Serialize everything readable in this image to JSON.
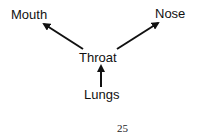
{
  "diagram": {
    "nodes": [
      {
        "id": "mouth",
        "label": "Mouth"
      },
      {
        "id": "nose",
        "label": "Nose"
      },
      {
        "id": "throat",
        "label": "Throat"
      },
      {
        "id": "lungs",
        "label": "Lungs"
      }
    ],
    "edges": [
      {
        "from": "lungs",
        "to": "throat"
      },
      {
        "from": "throat",
        "to": "mouth"
      },
      {
        "from": "throat",
        "to": "nose"
      }
    ]
  },
  "page_number": "25",
  "colors": {
    "ink": "#111111",
    "background": "#ffffff"
  }
}
